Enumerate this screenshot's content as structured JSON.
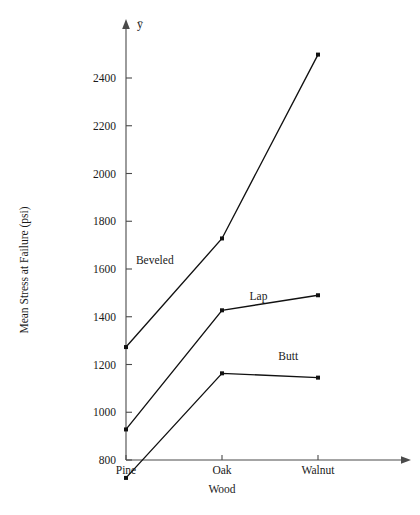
{
  "chart_data": {
    "type": "line",
    "title": "",
    "xlabel": "Wood",
    "ylabel": "Mean Stress at Failure (psi)",
    "y_variable_symbol": "ȳ",
    "categories": [
      "Pine",
      "Oak",
      "Walnut"
    ],
    "ylim": [
      700,
      2560
    ],
    "y_ticks": [
      800,
      1000,
      1200,
      1400,
      1600,
      1800,
      2000,
      2200,
      2400
    ],
    "y_tick_labels": [
      "800",
      "1000",
      "1200",
      "1400",
      "1600",
      "1800",
      "2000",
      "2200",
      "2400"
    ],
    "grid": false,
    "legend_position": "inline-annotations",
    "series": [
      {
        "name": "Beveled",
        "values": [
          1273,
          1728,
          2498
        ],
        "label_x_category_frac": 0.3,
        "label_value": 1620
      },
      {
        "name": "Lap",
        "values": [
          928,
          1427,
          1490
        ],
        "label_x_category_frac": 1.38,
        "label_value": 1470
      },
      {
        "name": "Butt",
        "values": [
          725,
          1163,
          1145
        ],
        "label_x_category_frac": 1.69,
        "label_value": 1218
      }
    ],
    "annotations": [
      {
        "text": "Beveled",
        "series": "Beveled"
      },
      {
        "text": "Lap",
        "series": "Lap"
      },
      {
        "text": "Butt",
        "series": "Butt"
      }
    ],
    "colors": {
      "line": "#111111",
      "axis": "#4a4a4a",
      "text": "#1a1a1a",
      "background": "#ffffff"
    }
  }
}
